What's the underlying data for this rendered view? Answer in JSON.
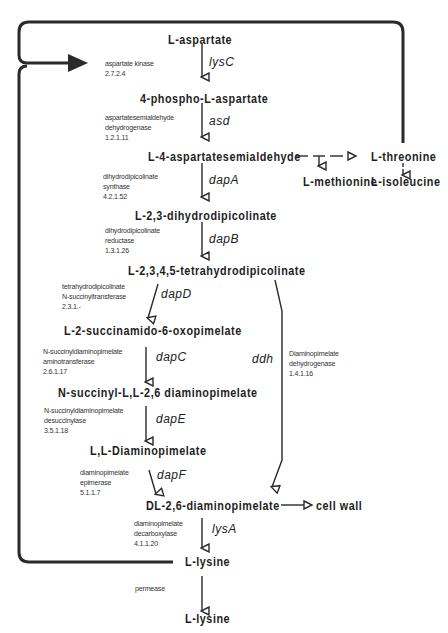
{
  "diagram": {
    "metabolites": {
      "aspartate": "L-aspartate",
      "phospho_aspartate": "4-phospho-L-aspartate",
      "semialdehyde": "L-4-aspartatesemialdehyde",
      "dihydrodipicolinate": "L-2,3-dihydrodipicolinate",
      "tetrahydrodipicolinate": "L-2,3,4,5-tetrahydrodipicolinate",
      "succinamido": "L-2-succinamido-6-oxopimelate",
      "succinyl_dap": "N-succinyl-L,L-2,6  diaminopimelate",
      "ll_dap": "L,L-Diaminopimelate",
      "dl_dap": "DL-2,6-diaminopimelate",
      "lysine_in": "L-lysine",
      "lysine_out": "L-lysine",
      "threonine": "L-threonine",
      "methionine": "L-methionine",
      "isoleucine": "L-isoleucine",
      "cell_wall": "cell wall"
    },
    "genes": {
      "lysC": "lysC",
      "asd": "asd",
      "dapA": "dapA",
      "dapB": "dapB",
      "dapD": "dapD",
      "dapC": "dapC",
      "dapE": "dapE",
      "dapF": "dapF",
      "ddh": "ddh",
      "lysA": "lysA"
    },
    "enzymes": {
      "lysC": [
        "aspartate kinase",
        "2.7.2.4"
      ],
      "asd": [
        "aspartatesemialdehyde",
        "dehydrogenase",
        "1.2.1.11"
      ],
      "dapA": [
        "dihydrodipicolinate",
        "synthase",
        "4.2.1.52"
      ],
      "dapB": [
        "dihydrodipicolinate",
        "reductase",
        "1.3.1.26"
      ],
      "dapD": [
        "tetrahydrodipicolinate",
        "N-succinyltransferase",
        "2.3.1.-"
      ],
      "dapC": [
        "N-succinyldiaminopimelate",
        "aminotransferase",
        "2.6.1.17"
      ],
      "dapE": [
        "N-succinyldiaminopimelate",
        "desuccinylase",
        "3.5.1.18"
      ],
      "dapF": [
        "diaminopimelate",
        "epimerase",
        "5.1.1.7"
      ],
      "ddh": [
        "Diaminopimelate",
        "dehydrogenase",
        "1.4.1.16"
      ],
      "lysA": [
        "diaminopimelate",
        "decarboxylase",
        "4.1.1.20"
      ],
      "permease": [
        "permease"
      ]
    },
    "colors": {
      "line": "#2a2a2a",
      "text": "#1e1e1e",
      "background": "#ffffff"
    }
  }
}
